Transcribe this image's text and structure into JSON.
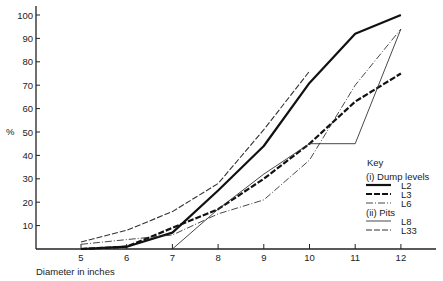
{
  "chart_data": {
    "type": "line",
    "title": "",
    "xlabel": "Diameter  in  inches",
    "ylabel": "%",
    "x_ticks": [
      5,
      6,
      7,
      8,
      9,
      10,
      11,
      12
    ],
    "y_ticks": [
      10,
      20,
      30,
      40,
      50,
      60,
      70,
      80,
      90,
      100
    ],
    "xlim": [
      4,
      12.5
    ],
    "ylim": [
      0,
      104
    ],
    "grid": false,
    "legend": {
      "title": "Key",
      "position": "lower right",
      "groups": [
        {
          "label": "(i)  Dump  levels",
          "entries": [
            "L2",
            "L3",
            "L6"
          ]
        },
        {
          "label": "(ii)  Pits",
          "entries": [
            "L8",
            "L33"
          ]
        }
      ]
    },
    "series": [
      {
        "name": "L2",
        "group": "Dump levels",
        "style": "thick-solid",
        "x": [
          5,
          6,
          7,
          8,
          9,
          10,
          11,
          12
        ],
        "values": [
          0,
          1,
          7,
          25,
          44,
          71,
          92,
          100
        ]
      },
      {
        "name": "L3",
        "group": "Dump levels",
        "style": "thick-dash",
        "x": [
          5,
          6,
          7,
          8,
          9,
          10,
          11,
          12
        ],
        "values": [
          0,
          1,
          9,
          17,
          30,
          45,
          63,
          75
        ]
      },
      {
        "name": "L6",
        "group": "Dump levels",
        "style": "dash-dot",
        "x": [
          5,
          6,
          7,
          8,
          9,
          10,
          11,
          12
        ],
        "values": [
          2,
          4,
          6,
          15,
          21,
          38,
          70,
          94
        ]
      },
      {
        "name": "L8",
        "group": "Pits",
        "style": "thin-solid",
        "x": [
          7,
          8,
          9,
          10,
          11,
          12
        ],
        "values": [
          0,
          17,
          32,
          45,
          45,
          94
        ]
      },
      {
        "name": "L33",
        "group": "Pits",
        "style": "long-dash",
        "x": [
          5,
          6,
          7,
          8,
          9,
          10
        ],
        "values": [
          3,
          8,
          16,
          28,
          51,
          76
        ]
      }
    ]
  },
  "labels": {
    "y_axis": "%",
    "x_axis": "Diameter  in  inches",
    "key_title": "Key",
    "key_group1": "(i)  Dump  levels",
    "key_group2": "(ii)  Pits",
    "key_l2": "L2",
    "key_l3": "L3",
    "key_l6": "L6",
    "key_l8": "L8",
    "key_l33": "L33"
  }
}
